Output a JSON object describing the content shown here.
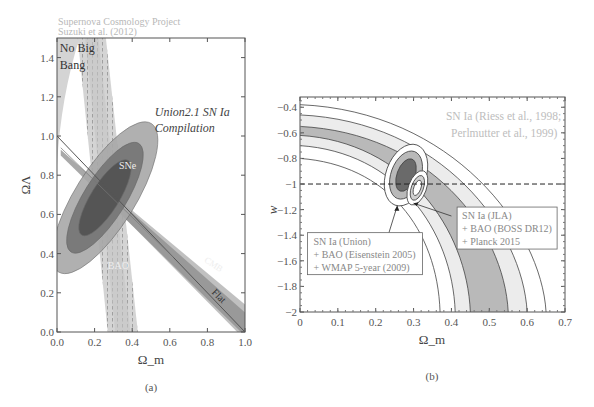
{
  "chart_data": [
    {
      "type": "contour",
      "panel_label": "(a)",
      "header": [
        "Supernova Cosmology Project",
        "Suzuki et al. (2012)"
      ],
      "xlabel": "Ω_m",
      "ylabel": "ΩΛ",
      "xlim": [
        0.0,
        1.0
      ],
      "ylim": [
        0.0,
        1.5
      ],
      "xticks": [
        "0.0",
        "0.2",
        "0.4",
        "0.6",
        "0.8",
        "1.0"
      ],
      "yticks": [
        "0.0",
        "0.2",
        "0.4",
        "0.6",
        "0.8",
        "1.0",
        "1.2",
        "1.4"
      ],
      "annotations": {
        "no_big_bang": [
          "No Big",
          "Bang"
        ],
        "compilation": [
          "Union2.1 SN Ia",
          "Compilation"
        ],
        "sne": "SNe",
        "bao": "BAO",
        "cmb": "CMB",
        "flat": "Flat"
      },
      "sne_contours": {
        "center": [
          0.28,
          0.72
        ],
        "confidence_levels": [
          "68.3%",
          "95.4%",
          "99.7%"
        ],
        "colors": [
          "#555555",
          "#7a7a7a",
          "#a8a8a8"
        ]
      },
      "bao_band": {
        "omega_m_range": [
          0.27,
          0.43
        ],
        "center": 0.33
      },
      "cmb_band": {
        "line": [
          [
            0.0,
            0.95
          ],
          [
            1.0,
            0.05
          ]
        ]
      },
      "flat_line": [
        [
          0.0,
          1.0
        ],
        [
          1.0,
          0.0
        ]
      ],
      "no_big_bang_region": [
        [
          0.0,
          0.85
        ],
        [
          0.0,
          1.5
        ],
        [
          0.12,
          1.5
        ]
      ]
    },
    {
      "type": "contour",
      "panel_label": "(b)",
      "xlabel": "Ω_m",
      "ylabel": "w",
      "xlim": [
        0,
        0.7
      ],
      "ylim": [
        -2,
        -0.32
      ],
      "xticks": [
        "0",
        "0.1",
        "0.2",
        "0.3",
        "0.4",
        "0.5",
        "0.6",
        "0.7"
      ],
      "yticks": [
        "-0.4",
        "-0.6",
        "-0.8",
        "-1",
        "-1.2",
        "-1.4",
        "-1.6",
        "-1.8",
        "-2"
      ],
      "reference_line": {
        "w": -1,
        "style": "dashed"
      },
      "legends": {
        "riess": [
          "SN Ia (Riess et al., 1998;",
          "Perlmutter et al., 1999)"
        ],
        "union": [
          "SN Ia (Union)",
          "+ BAO (Eisenstein 2005)",
          "+ WMAP 5-year (2009)"
        ],
        "jla": [
          "SN Ia (JLA)",
          "+ BAO (BOSS DR12)",
          "+ Planck 2015"
        ]
      },
      "riess_band_x_at_w_minus2": [
        0.37,
        0.41,
        0.45,
        0.55,
        0.6,
        0.65
      ],
      "union_contour_center": [
        0.28,
        -0.93
      ],
      "jla_contour_center": [
        0.31,
        -1.03
      ]
    }
  ]
}
